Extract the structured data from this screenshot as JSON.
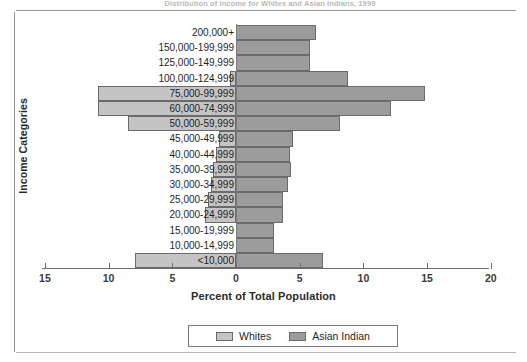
{
  "caption": "Distribution of Income for Whites and Asian Indians, 1999",
  "chart_data": {
    "type": "bar",
    "orientation": "horizontal",
    "subtype": "population-pyramid",
    "title": "Distribution of Income for Whites and Asian Indians, 1999",
    "xlabel": "Percent of Total Population",
    "ylabel": "Income Categories",
    "grid": false,
    "legend_position": "bottom-center",
    "xlim": [
      -15,
      20
    ],
    "x_ticks": [
      -15,
      -10,
      -5,
      0,
      5,
      10,
      15,
      20
    ],
    "x_tick_labels": [
      "15",
      "10",
      "5",
      "0",
      "5",
      "10",
      "15",
      "20"
    ],
    "categories": [
      "200,000+",
      "150,000-199,999",
      "125,000-149,999",
      "100,000-124,999",
      "75,000-99,999",
      "60,000-74,999",
      "50,000-59,999",
      "45,000-49,999",
      "40,000-44,999",
      "35,000-39,999",
      "30,000-34,999",
      "25,000-29,999",
      "20,000-24,999",
      "15,000-19,999",
      "10,000-14,999",
      "<10,000"
    ],
    "series": [
      {
        "name": "Whites",
        "side": "left",
        "color": "#c4c4c4",
        "values": [
          0.0,
          0.0,
          0.0,
          0.5,
          10.8,
          10.8,
          8.5,
          1.3,
          1.6,
          1.8,
          2.0,
          2.2,
          2.4,
          0.0,
          0.0,
          7.9
        ]
      },
      {
        "name": "Asian Indian",
        "side": "right",
        "color": "#9c9c9c",
        "values": [
          6.3,
          5.8,
          5.8,
          8.8,
          14.8,
          12.2,
          8.2,
          4.5,
          4.2,
          4.3,
          4.1,
          3.7,
          3.7,
          3.0,
          3.0,
          6.8
        ]
      }
    ]
  },
  "legend": {
    "items": [
      {
        "label": "Whites",
        "color": "#c4c4c4"
      },
      {
        "label": "Asian Indian",
        "color": "#9c9c9c"
      }
    ]
  }
}
